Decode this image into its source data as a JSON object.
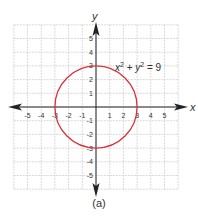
{
  "chart_data": {
    "type": "line",
    "title": "",
    "caption": "(a)",
    "xlabel": "x",
    "ylabel": "y",
    "xlim": [
      -6,
      6
    ],
    "ylim": [
      -6,
      6
    ],
    "grid": true,
    "x_ticks": [
      -5,
      -4,
      -3,
      -2,
      -1,
      1,
      2,
      3,
      4,
      5
    ],
    "y_ticks": [
      -5,
      -4,
      -3,
      -2,
      -1,
      1,
      2,
      3,
      4,
      5
    ],
    "series": [
      {
        "name": "x^2 + y^2 = 9",
        "shape": "circle",
        "center": [
          0,
          0
        ],
        "radius": 3,
        "color": "#d9303a"
      }
    ],
    "annotations": [
      {
        "text": "x² + y² = 9",
        "x": 3.5,
        "y": 3.5
      }
    ]
  },
  "colors": {
    "grid": "#c8c8c8",
    "axis": "#222222",
    "curve": "#d9303a",
    "text": "#333333"
  }
}
